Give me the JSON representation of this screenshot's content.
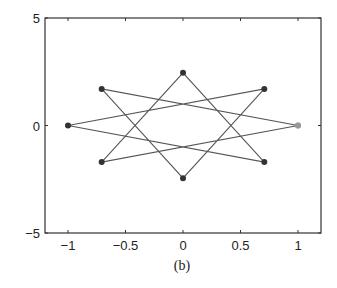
{
  "chart_data": {
    "type": "line",
    "title": "",
    "caption": "(b)",
    "xlabel": "",
    "ylabel": "",
    "xlim": [
      -1.2,
      1.2
    ],
    "ylim": [
      -5,
      5
    ],
    "xticks": [
      -1,
      -0.5,
      0,
      0.5,
      1
    ],
    "xtick_labels": [
      "−1",
      "−0.5",
      "0",
      "0.5",
      "1"
    ],
    "yticks": [
      -5,
      0,
      5
    ],
    "ytick_labels": [
      "−5",
      "0",
      "5"
    ],
    "grid": false,
    "legend": null,
    "series": [
      {
        "name": "star polygon",
        "marker": "circle",
        "line_color": "#555555",
        "marker_color": "#333333",
        "x": [
          1,
          -0.707,
          0,
          0.707,
          -1,
          0.707,
          0,
          -0.707,
          1
        ],
        "y": [
          0,
          1.7,
          -2.45,
          1.7,
          0,
          -1.7,
          2.45,
          -1.7,
          0
        ]
      }
    ],
    "highlight_point": {
      "x": 1,
      "y": 0,
      "color": "#999999"
    }
  }
}
